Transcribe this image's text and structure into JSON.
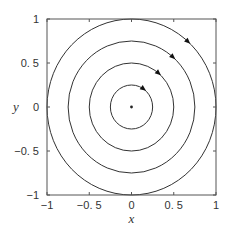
{
  "chart_data": {
    "type": "line",
    "title": "",
    "xlabel": "x",
    "ylabel": "y",
    "xlim": [
      -1,
      1
    ],
    "ylim": [
      -1,
      1
    ],
    "grid": false,
    "xticks": [
      -1,
      -0.5,
      0,
      0.5,
      1
    ],
    "yticks": [
      -1,
      -0.5,
      0,
      0.5,
      1
    ],
    "xtick_labels": [
      "−1",
      "−0. 5",
      "0",
      "0. 5",
      "1"
    ],
    "ytick_labels": [
      "−1",
      "−0. 5",
      "0",
      "0. 5",
      "1"
    ],
    "equilibrium_point": {
      "x": 0,
      "y": 0
    },
    "series": [
      {
        "name": "orbit r=0.25",
        "radius": 0.25,
        "direction": "clockwise",
        "arrow_angle_deg": 55
      },
      {
        "name": "orbit r=0.5",
        "radius": 0.5,
        "direction": "clockwise",
        "arrow_angle_deg": 50
      },
      {
        "name": "orbit r=0.75",
        "radius": 0.75,
        "direction": "clockwise",
        "arrow_angle_deg": 49
      },
      {
        "name": "orbit r=1.0",
        "radius": 1.0,
        "direction": "clockwise",
        "arrow_angle_deg": 48
      }
    ]
  },
  "colors": {
    "line": "#333333",
    "axes": "#555555",
    "background": "#ffffff"
  }
}
